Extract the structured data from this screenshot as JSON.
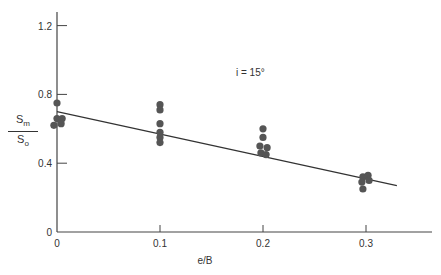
{
  "chart_data": {
    "type": "scatter",
    "title": "",
    "annotation": "i = 15°",
    "xlabel": "e/B",
    "ylabel": {
      "numerator": "S",
      "numerator_sub": "m",
      "denominator": "S",
      "denominator_sub": "o"
    },
    "xlim": [
      0,
      0.35
    ],
    "ylim": [
      0,
      1.3
    ],
    "xticks": [
      0,
      0.1,
      0.2,
      0.3
    ],
    "xtick_labels": [
      "0",
      "0.1",
      "0.2",
      "0.3"
    ],
    "yticks": [
      0,
      0.4,
      0.8,
      1.2
    ],
    "ytick_labels": [
      "0",
      "0.4",
      "0.8",
      "1.2"
    ],
    "grid": false,
    "legend": null,
    "series": [
      {
        "name": "Measured",
        "marker": "filled-circle",
        "color": "#555555",
        "points": [
          [
            0.0,
            0.75
          ],
          [
            0.0,
            0.66
          ],
          [
            0.005,
            0.66
          ],
          [
            -0.003,
            0.62
          ],
          [
            0.004,
            0.63
          ],
          [
            0.1,
            0.74
          ],
          [
            0.1,
            0.71
          ],
          [
            0.1,
            0.63
          ],
          [
            0.1,
            0.58
          ],
          [
            0.1,
            0.55
          ],
          [
            0.1,
            0.52
          ],
          [
            0.2,
            0.6
          ],
          [
            0.2,
            0.55
          ],
          [
            0.197,
            0.5
          ],
          [
            0.204,
            0.49
          ],
          [
            0.198,
            0.46
          ],
          [
            0.203,
            0.45
          ],
          [
            0.297,
            0.32
          ],
          [
            0.302,
            0.33
          ],
          [
            0.303,
            0.3
          ],
          [
            0.296,
            0.29
          ],
          [
            0.297,
            0.25
          ]
        ]
      },
      {
        "name": "Trend line",
        "type": "line",
        "color": "#333333",
        "points": [
          [
            0.0,
            0.7
          ],
          [
            0.33,
            0.27
          ]
        ]
      }
    ]
  }
}
